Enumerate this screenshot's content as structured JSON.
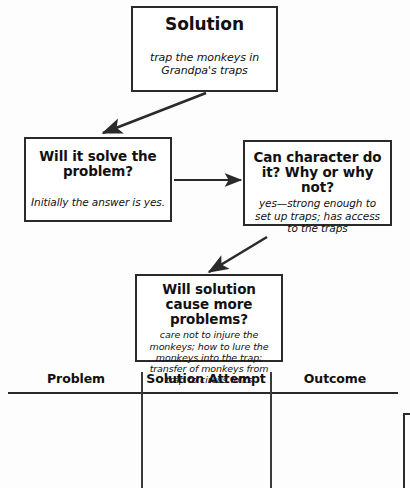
{
  "page": {
    "kind": "story-planning-flowchart",
    "background_color": "#fdfdfd",
    "ink_color": "#2a2a2a"
  },
  "flowchart": {
    "nodes": [
      {
        "id": "solution",
        "title": "Solution",
        "detail": "trap the monkeys in Grandpa's traps"
      },
      {
        "id": "will-it-solve",
        "title": "Will it solve the problem?",
        "detail": "Initially the answer is yes."
      },
      {
        "id": "can-character",
        "title": "Can character do it? Why or why not?",
        "detail": "yes—strong enough to set up traps; has access to the traps"
      },
      {
        "id": "more-problems",
        "title": "Will solution cause more problems?",
        "detail": "care not to injure the monkeys; how to lure the monkeys into the trap; transfer of monkeys from trap to circus folks"
      }
    ],
    "connectors": [
      {
        "id": "solution-to-will-it-solve",
        "from": "solution",
        "to": "will-it-solve",
        "style": "diagonal-arrow"
      },
      {
        "id": "will-it-solve-to-can-character",
        "from": "will-it-solve",
        "to": "can-character",
        "style": "horizontal-arrow"
      },
      {
        "id": "can-character-to-more-problems",
        "from": "can-character",
        "to": "more-problems",
        "style": "diagonal-arrow"
      }
    ]
  },
  "table": {
    "columns": [
      "Problem",
      "Solution Attempt",
      "Outcome"
    ],
    "rows": []
  }
}
